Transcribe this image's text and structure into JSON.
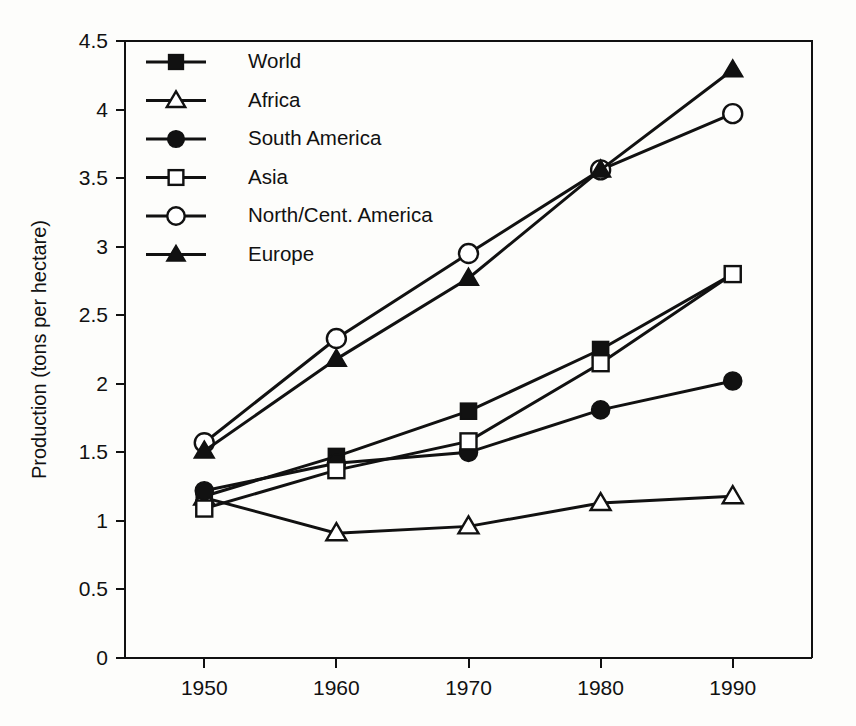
{
  "chart_data": {
    "type": "line",
    "title": "",
    "xlabel": "",
    "ylabel": "Production (tons per hectare)",
    "x": [
      1950,
      1960,
      1970,
      1980,
      1990
    ],
    "xtick_labels": [
      "1950",
      "1960",
      "1970",
      "1980",
      "1990"
    ],
    "ytick_labels": [
      "0",
      "0.5",
      "1",
      "1.5",
      "2",
      "2.5",
      "3",
      "3.5",
      "4",
      "4.5"
    ],
    "yticks": [
      0,
      0.5,
      1,
      1.5,
      2,
      2.5,
      3,
      3.5,
      4,
      4.5
    ],
    "xlim": [
      1944,
      1996
    ],
    "ylim": [
      0,
      4.5
    ],
    "grid": false,
    "legend_position": "top-left-inside",
    "series": [
      {
        "name": "World",
        "marker": "filled-square",
        "values": [
          1.18,
          1.47,
          1.8,
          2.25,
          2.8
        ]
      },
      {
        "name": "Africa",
        "marker": "open-triangle",
        "values": [
          1.17,
          0.91,
          0.96,
          1.13,
          1.18
        ]
      },
      {
        "name": "South America",
        "marker": "filled-circle",
        "values": [
          1.22,
          1.42,
          1.5,
          1.81,
          2.02
        ]
      },
      {
        "name": "Asia",
        "marker": "open-square",
        "values": [
          1.09,
          1.37,
          1.58,
          2.15,
          2.8
        ]
      },
      {
        "name": "North/Cent. America",
        "marker": "open-circle",
        "values": [
          1.57,
          2.33,
          2.95,
          3.56,
          3.97
        ]
      },
      {
        "name": "Europe",
        "marker": "filled-triangle",
        "values": [
          1.51,
          2.18,
          2.77,
          3.56,
          4.29
        ]
      }
    ]
  },
  "legend": {
    "entries": [
      {
        "label": "World"
      },
      {
        "label": "Africa"
      },
      {
        "label": "South America"
      },
      {
        "label": "Asia"
      },
      {
        "label": "North/Cent. America"
      },
      {
        "label": "Europe"
      }
    ]
  },
  "colors": {
    "ink": "#111111",
    "background": "#fdfdfb",
    "marker_fill_open": "#ffffff"
  }
}
